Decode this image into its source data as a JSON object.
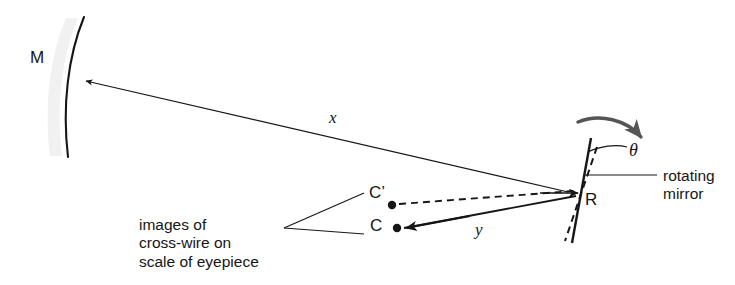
{
  "diagram": {
    "background_color": "#ffffff",
    "stroke_color": "#161616",
    "rotation_arrow_color": "#555555",
    "mirror_shadow_color": "#f1f1f1",
    "labels": {
      "mirror_M": "M",
      "rotating_mirror_point": "R",
      "image_c_prime": "C’",
      "image_c": "C",
      "distance_x": "x",
      "distance_y": "y",
      "angle_theta": "θ",
      "rotating_mirror": "rotating\nmirror",
      "images_caption": "images of\ncross-wire on\nscale of eyepiece"
    },
    "elements": {
      "concave_mirror": "concave-mirror-arc",
      "rotating_mirror_solid": "rotating-mirror-line",
      "rotating_mirror_dashed": "rotating-mirror-previous-position-line",
      "ray_x": "ray-from-rotating-mirror-to-concave-mirror",
      "ray_y_solid": "ray-to-image-c",
      "ray_y_dashed": "ray-to-image-c-prime",
      "rotation_arrow": "rotation-direction-arrow",
      "angle_arc": "theta-angle-arc",
      "leader_rotating_mirror": "leader-line-rotating-mirror",
      "leader_c_prime": "leader-line-c-prime",
      "leader_c": "leader-line-c"
    }
  }
}
